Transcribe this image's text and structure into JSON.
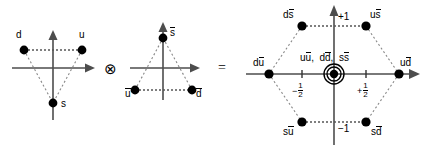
{
  "figure": {
    "operator_tensor": "⊗",
    "operator_equals": "=",
    "point_color": "#000000",
    "axis_color": "#4d4d4d",
    "dotted_color": "#808080"
  },
  "triangle_fundamental": {
    "name": "fundamental-triplet",
    "vertices": [
      {
        "label": "u",
        "x": 0.5,
        "y": 0.333
      },
      {
        "label": "d",
        "x": -0.5,
        "y": 0.333
      },
      {
        "label": "s",
        "x": 0.0,
        "y": -0.667
      }
    ]
  },
  "triangle_antifundamental": {
    "name": "antifundamental-triplet",
    "vertices": [
      {
        "label": "u",
        "bar": true,
        "x": -0.5,
        "y": -0.333
      },
      {
        "label": "d",
        "bar": true,
        "x": 0.5,
        "y": -0.333
      },
      {
        "label": "s",
        "bar": true,
        "x": 0.0,
        "y": 0.667
      }
    ]
  },
  "hexagon": {
    "name": "meson-nonet-hexagon",
    "vertices": [
      {
        "id": "ds-bar",
        "q": "d",
        "aq": "s",
        "x": -0.5,
        "y": 1.0
      },
      {
        "id": "us-bar",
        "q": "u",
        "aq": "s",
        "x": 0.5,
        "y": 1.0
      },
      {
        "id": "ud-bar",
        "q": "u",
        "aq": "d",
        "x": 1.0,
        "y": 0.0
      },
      {
        "id": "sd-bar",
        "q": "s",
        "aq": "d",
        "x": 0.5,
        "y": -1.0
      },
      {
        "id": "su-bar",
        "q": "s",
        "aq": "u",
        "x": -0.5,
        "y": -1.0
      },
      {
        "id": "du-bar",
        "q": "d",
        "aq": "u",
        "x": -1.0,
        "y": 0.0
      }
    ],
    "center_states": [
      {
        "q": "u",
        "aq": "u"
      },
      {
        "q": "d",
        "aq": "d"
      },
      {
        "q": "s",
        "aq": "s"
      }
    ],
    "center_separator_1": ",",
    "center_separator_2": ",",
    "center_multiplicity": 3,
    "axis_ticks": {
      "top": "+1",
      "bottom": "−1",
      "left_sign": "−",
      "left_num": "1",
      "left_den": "2",
      "right_sign": "+",
      "right_num": "1",
      "right_den": "2"
    }
  }
}
